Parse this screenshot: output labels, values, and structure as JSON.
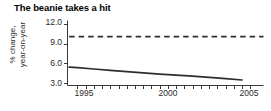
{
  "chart_data": {
    "type": "line",
    "title": "The beanie takes a hit",
    "xlabel": "",
    "ylabel": "% change, year-on-year",
    "ylabel_line1": "% change,",
    "ylabel_line2": "year-on-year",
    "xlim": [
      1994.4,
      2006.3
    ],
    "ylim": [
      2.55,
      12.6
    ],
    "yticks": [
      12.0,
      9.0,
      6.0,
      3.0
    ],
    "ytick_labels": [
      "12.0",
      "9.0",
      "6.0",
      "3.0"
    ],
    "xticks": [
      1995,
      1995.5,
      1996,
      1996.5,
      1997,
      1997.5,
      1998,
      1998.5,
      1999,
      1999.5,
      2000,
      2000.5,
      2001,
      2001.5,
      2002,
      2002.5,
      2003,
      2003.5,
      2004,
      2004.5,
      2005,
      2005.5
    ],
    "xtick_labels": [
      "1995",
      "2000",
      "2005"
    ],
    "xtick_label_positions": [
      1995,
      2000,
      2005
    ],
    "grid": false,
    "legend": false,
    "series": [
      {
        "name": "year-on-year % change",
        "style": "solid",
        "color": "#2e2e2e",
        "x": [
          1994.5,
          1995,
          1996,
          1997,
          1998,
          1999,
          2000,
          2001,
          2002,
          2003,
          2004,
          2005
        ],
        "values": [
          5.4,
          5.3,
          5.1,
          4.9,
          4.7,
          4.5,
          4.3,
          4.15,
          4.0,
          3.8,
          3.6,
          3.4
        ]
      },
      {
        "name": "reference level",
        "style": "dashed",
        "color": "#2e2e2e",
        "x": [
          1994.5,
          2006.3
        ],
        "values": [
          10.1,
          10.1
        ]
      }
    ]
  },
  "axes": {
    "axis_color": "#3a3a3a",
    "tick_color": "#3a3a3a"
  },
  "accent": {
    "background": "#ffffff",
    "text": "#1a1a1a"
  }
}
